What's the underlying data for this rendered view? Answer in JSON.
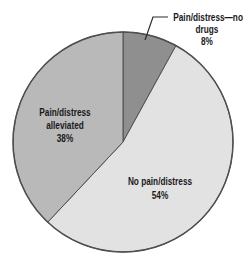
{
  "chart_data": {
    "type": "pie",
    "title": "",
    "start_angle_deg": 0,
    "direction": "clockwise",
    "background": "#ffffff",
    "outline_color": "#4f4f4f",
    "leader_line_color": "#2b2b2b",
    "label_color": "#1a1a1a",
    "slices": [
      {
        "label": "Pain/distress—no drugs",
        "value": 8,
        "percent_label": "8%",
        "color": "#8f8f8f"
      },
      {
        "label": "No pain/distress",
        "value": 54,
        "percent_label": "54%",
        "color": "#e2e2e2"
      },
      {
        "label": "Pain/distress alleviated",
        "value": 38,
        "percent_label": "38%",
        "color": "#b9b9b9"
      }
    ]
  },
  "labels": {
    "no_drugs": {
      "line1": "Pain/distress—no",
      "line2": "drugs",
      "line3": "8%"
    },
    "alleviated": {
      "line1": "Pain/distress",
      "line2": "alleviated",
      "line3": "38%"
    },
    "no_pain": {
      "line1": "No pain/distress",
      "line2": "54%"
    }
  }
}
